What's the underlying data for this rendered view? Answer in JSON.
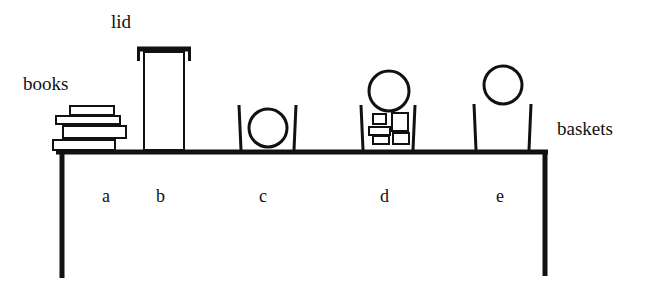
{
  "labels": {
    "books": "books",
    "lid": "lid",
    "baskets": "baskets"
  },
  "positions": [
    {
      "id": "a",
      "label": "a",
      "object": "books"
    },
    {
      "id": "b",
      "label": "b",
      "object": "tall container with lid"
    },
    {
      "id": "c",
      "label": "c",
      "object": "basket with ball inside"
    },
    {
      "id": "d",
      "label": "d",
      "object": "basket with blocks and ball on top"
    },
    {
      "id": "e",
      "label": "e",
      "object": "basket with ball above"
    }
  ],
  "colors": {
    "ink": "#111111",
    "background": "#ffffff"
  }
}
